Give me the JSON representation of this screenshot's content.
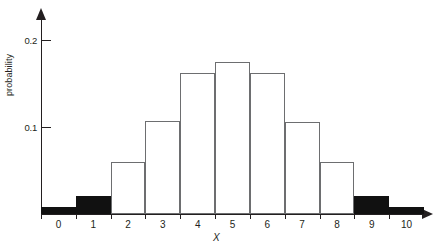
{
  "chart_data": {
    "type": "bar",
    "title": "",
    "xlabel": "X",
    "ylabel": "probability",
    "categories": [
      "0",
      "1",
      "2",
      "3",
      "4",
      "5",
      "6",
      "7",
      "8",
      "9",
      "10"
    ],
    "values": [
      0.008,
      0.021,
      0.06,
      0.107,
      0.162,
      0.175,
      0.162,
      0.106,
      0.06,
      0.021,
      0.008
    ],
    "bar_fill": [
      "filled",
      "filled",
      "open",
      "open",
      "open",
      "open",
      "open",
      "open",
      "open",
      "filled",
      "filled"
    ],
    "ylim": [
      0,
      0.225
    ],
    "xlim": [
      0,
      11
    ],
    "y_ticks": [
      0.1,
      0.2
    ],
    "y_tick_labels": [
      "0.1",
      "0.2"
    ],
    "x_tick_labels": [
      "0",
      "1",
      "2",
      "3",
      "4",
      "5",
      "6",
      "7",
      "8",
      "9",
      "10"
    ],
    "grid": false,
    "legend": null,
    "colors": {
      "bar_outline": "#6d6e70",
      "bar_open_fill": "#ffffff",
      "bar_filled": "#111111",
      "axis": "#231f20",
      "text": "#231f20",
      "background": "#ffffff"
    }
  },
  "axes": {
    "y_arrow": "up-arrow",
    "x_arrow": "right-arrow"
  }
}
